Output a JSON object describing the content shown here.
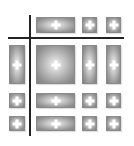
{
  "icon": {
    "name": "table-grid-icon",
    "colors": {
      "line": "#222222",
      "cell_edge": "#7e7e7e",
      "cell_center": "#f4f4f4",
      "plus": "#ffffff"
    },
    "lines": {
      "vertical": {
        "x": 29,
        "y": 15,
        "w": 2,
        "h": 121
      },
      "horizontal": {
        "x": 8,
        "y": 37,
        "w": 116,
        "h": 2
      }
    },
    "cells": [
      {
        "x": 36,
        "y": 17,
        "w": 39,
        "h": 16
      },
      {
        "x": 82,
        "y": 17,
        "w": 15,
        "h": 16
      },
      {
        "x": 106,
        "y": 17,
        "w": 15,
        "h": 16
      },
      {
        "x": 9,
        "y": 45,
        "w": 16,
        "h": 39
      },
      {
        "x": 36,
        "y": 45,
        "w": 39,
        "h": 39
      },
      {
        "x": 82,
        "y": 45,
        "w": 15,
        "h": 39
      },
      {
        "x": 106,
        "y": 45,
        "w": 15,
        "h": 39
      },
      {
        "x": 9,
        "y": 93,
        "w": 16,
        "h": 15
      },
      {
        "x": 36,
        "y": 93,
        "w": 39,
        "h": 15
      },
      {
        "x": 82,
        "y": 93,
        "w": 15,
        "h": 15
      },
      {
        "x": 106,
        "y": 93,
        "w": 15,
        "h": 15
      },
      {
        "x": 9,
        "y": 116,
        "w": 16,
        "h": 15
      },
      {
        "x": 36,
        "y": 116,
        "w": 39,
        "h": 15
      },
      {
        "x": 82,
        "y": 116,
        "w": 15,
        "h": 15
      },
      {
        "x": 106,
        "y": 116,
        "w": 15,
        "h": 15
      }
    ]
  }
}
